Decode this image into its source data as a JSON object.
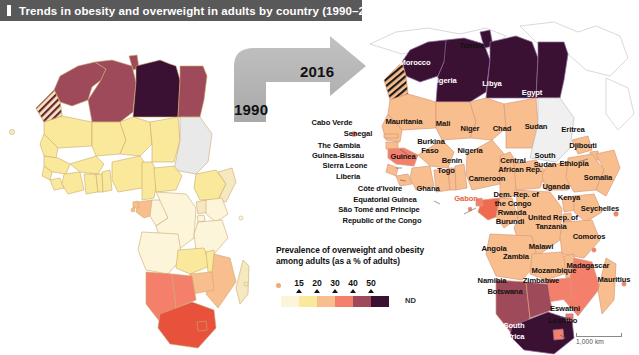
{
  "banner": {
    "title": "Trends in obesity and overweight in adults by country (1990–2016)",
    "bg_color": "#595959",
    "text_color": "#ffffff"
  },
  "arrow": {
    "from_year": "1990",
    "to_year": "2016",
    "color": "#b3b3b3"
  },
  "legend": {
    "title_line1": "Prevalence of overweight and obesity",
    "title_line2": "among adults (as a % of adults)",
    "tick_labels": [
      "15",
      "20",
      "30",
      "40",
      "50"
    ],
    "no_data_label": "ND",
    "swatch_colors": [
      "#fdf5d9",
      "#fae99b",
      "#f9be8e",
      "#f4806b",
      "#9e4a5a",
      "#3b1133"
    ],
    "no_data_color": "#efefef",
    "island_dot_color": "#f2a878"
  },
  "scale": {
    "label": "1,000 km"
  },
  "chart_data": {
    "type": "choropleth-map",
    "title": "Trends in obesity and overweight in adults by country (1990–2016)",
    "value_label": "Prevalence of overweight and obesity among adults (as a % of adults)",
    "unit": "% of adults",
    "bins": [
      {
        "label": "<15",
        "color": "#fdf5d9"
      },
      {
        "label": "15–20",
        "color": "#fae99b"
      },
      {
        "label": "20–30",
        "color": "#f9be8e"
      },
      {
        "label": "30–40",
        "color": "#f4806b"
      },
      {
        "label": "40–50",
        "color": "#9e4a5a"
      },
      {
        "label": ">50",
        "color": "#3b1133"
      },
      {
        "label": "ND",
        "color": "#efefef"
      }
    ],
    "panels": [
      {
        "year": "1990",
        "position": "left"
      },
      {
        "year": "2016",
        "position": "right"
      }
    ]
  },
  "map_labels_2016": [
    {
      "name": "Morocco",
      "x": 415,
      "y": 62,
      "color": "#ffffff"
    },
    {
      "name": "Tunisia",
      "x": 472,
      "y": 45,
      "color": "#111111"
    },
    {
      "name": "Algeria",
      "x": 444,
      "y": 80,
      "color": "#ffffff"
    },
    {
      "name": "Libya",
      "x": 492,
      "y": 83,
      "color": "#ffffff"
    },
    {
      "name": "Egypt",
      "x": 532,
      "y": 92,
      "color": "#ffffff"
    },
    {
      "name": "Cabo Verde",
      "x": 332,
      "y": 122,
      "color": "#111111"
    },
    {
      "name": "Mauritania",
      "x": 404,
      "y": 121,
      "color": "#111111"
    },
    {
      "name": "Mali",
      "x": 443,
      "y": 123,
      "color": "#111111"
    },
    {
      "name": "Niger",
      "x": 470,
      "y": 128,
      "color": "#111111"
    },
    {
      "name": "Chad",
      "x": 502,
      "y": 128,
      "color": "#111111"
    },
    {
      "name": "Sudan",
      "x": 536,
      "y": 126,
      "color": "#111111"
    },
    {
      "name": "Eritrea",
      "x": 573,
      "y": 129,
      "color": "#111111"
    },
    {
      "name": "Senegal",
      "x": 358,
      "y": 133,
      "color": "#111111"
    },
    {
      "name": "Djibouti",
      "x": 583,
      "y": 145,
      "color": "#111111"
    },
    {
      "name": "The Gambia",
      "x": 339,
      "y": 145,
      "color": "#111111"
    },
    {
      "name": "Burkina",
      "x": 431,
      "y": 141,
      "color": "#111111"
    },
    {
      "name": "Faso",
      "x": 430,
      "y": 150,
      "color": "#111111"
    },
    {
      "name": "Nigeria",
      "x": 470,
      "y": 150,
      "color": "#111111"
    },
    {
      "name": "Guinea-Bissau",
      "x": 338,
      "y": 155,
      "color": "#111111"
    },
    {
      "name": "Guinea",
      "x": 403,
      "y": 156,
      "color": "#111111"
    },
    {
      "name": "Sierra Leone",
      "x": 345,
      "y": 165,
      "color": "#111111"
    },
    {
      "name": "Benin",
      "x": 452,
      "y": 160,
      "color": "#111111"
    },
    {
      "name": "Togo",
      "x": 446,
      "y": 170,
      "color": "#111111"
    },
    {
      "name": "Central",
      "x": 513,
      "y": 160,
      "color": "#111111"
    },
    {
      "name": "African Rep.",
      "x": 520,
      "y": 169,
      "color": "#111111"
    },
    {
      "name": "South",
      "x": 545,
      "y": 155,
      "color": "#111111"
    },
    {
      "name": "Sudan",
      "x": 545,
      "y": 164,
      "color": "#111111"
    },
    {
      "name": "Ethiopia",
      "x": 574,
      "y": 163,
      "color": "#111111"
    },
    {
      "name": "Liberia",
      "x": 348,
      "y": 176,
      "color": "#111111"
    },
    {
      "name": "Cameroon",
      "x": 487,
      "y": 178,
      "color": "#111111"
    },
    {
      "name": "Somalia",
      "x": 598,
      "y": 177,
      "color": "#111111"
    },
    {
      "name": "Côte d'Ivoire",
      "x": 380,
      "y": 188,
      "color": "#111111"
    },
    {
      "name": "Ghana",
      "x": 428,
      "y": 188,
      "color": "#111111"
    },
    {
      "name": "Uganda",
      "x": 556,
      "y": 186,
      "color": "#111111"
    },
    {
      "name": "Equatorial Guinea",
      "x": 385,
      "y": 199,
      "color": "#111111"
    },
    {
      "name": "Gabon",
      "x": 466,
      "y": 198,
      "color": "#e8603f"
    },
    {
      "name": "Dem. Rep. of",
      "x": 516,
      "y": 194,
      "color": "#111111"
    },
    {
      "name": "the Congo",
      "x": 513,
      "y": 203,
      "color": "#111111"
    },
    {
      "name": "Kenya",
      "x": 569,
      "y": 197,
      "color": "#111111"
    },
    {
      "name": "São Tomé and Principe",
      "x": 379,
      "y": 209,
      "color": "#111111"
    },
    {
      "name": "Rwanda",
      "x": 512,
      "y": 212,
      "color": "#111111"
    },
    {
      "name": "Seychelles",
      "x": 600,
      "y": 208,
      "color": "#111111"
    },
    {
      "name": "Republic of the Congo",
      "x": 382,
      "y": 220,
      "color": "#111111"
    },
    {
      "name": "Burundi",
      "x": 510,
      "y": 221,
      "color": "#111111"
    },
    {
      "name": "United Rep. of",
      "x": 553,
      "y": 217,
      "color": "#111111"
    },
    {
      "name": "Tanzania",
      "x": 551,
      "y": 226,
      "color": "#111111"
    },
    {
      "name": "Comoros",
      "x": 589,
      "y": 236,
      "color": "#111111"
    },
    {
      "name": "Angola",
      "x": 494,
      "y": 248,
      "color": "#111111"
    },
    {
      "name": "Malawi",
      "x": 541,
      "y": 246,
      "color": "#111111"
    },
    {
      "name": "Zambia",
      "x": 516,
      "y": 256,
      "color": "#111111"
    },
    {
      "name": "Mozambique",
      "x": 554,
      "y": 270,
      "color": "#111111"
    },
    {
      "name": "Madagascar",
      "x": 588,
      "y": 265,
      "color": "#111111"
    },
    {
      "name": "Mauritius",
      "x": 614,
      "y": 279,
      "color": "#111111"
    },
    {
      "name": "Namibia",
      "x": 492,
      "y": 280,
      "color": "#111111"
    },
    {
      "name": "Zimbabwe",
      "x": 541,
      "y": 280,
      "color": "#111111"
    },
    {
      "name": "Botswana",
      "x": 505,
      "y": 291,
      "color": "#111111"
    },
    {
      "name": "Eswatini",
      "x": 565,
      "y": 308,
      "color": "#111111"
    },
    {
      "name": "Lesotho",
      "x": 563,
      "y": 320,
      "color": "#111111"
    },
    {
      "name": "South",
      "x": 514,
      "y": 325,
      "color": "#ffffff"
    },
    {
      "name": "Africa",
      "x": 514,
      "y": 336,
      "color": "#ffffff"
    }
  ]
}
